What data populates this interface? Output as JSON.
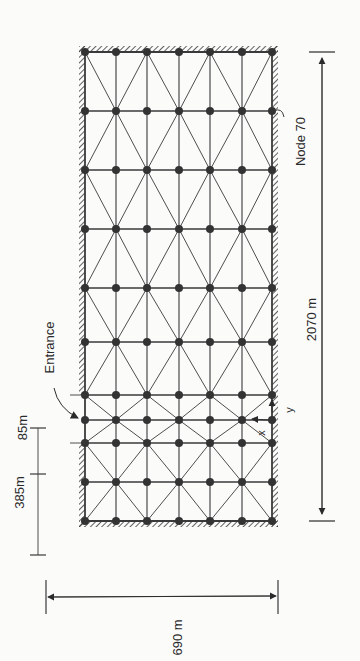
{
  "diagram": {
    "type": "finite-element-mesh",
    "colors": {
      "line": "#3a3a3a",
      "node": "#333333",
      "background": "#fbfbfa",
      "hatch": "#3a3a3a"
    },
    "columns_x": [
      85,
      116,
      147,
      179,
      210,
      242,
      272
    ],
    "rows_y": [
      52,
      111,
      170,
      229,
      288,
      342,
      395,
      420,
      443,
      482,
      521
    ],
    "labels": {
      "node": "Node  70",
      "total_length": "2070 m",
      "width": "690 m",
      "upper_segment": "85m",
      "lower_segment": "385m",
      "entrance": "Entrance",
      "axis_x": "x",
      "axis_y": "y"
    }
  }
}
